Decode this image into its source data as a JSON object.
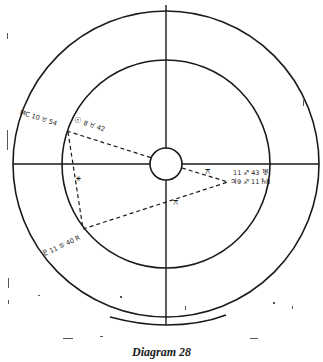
{
  "caption": "Diagram 28",
  "wheel": {
    "rings": [
      "outer",
      "inner",
      "center"
    ],
    "axes": [
      "horizontal",
      "vertical"
    ]
  },
  "labels": {
    "midheaven": {
      "glyph": "M\nC",
      "text": "MC 10 ♉ 54"
    },
    "sun": {
      "glyph": "☉",
      "text": "8 ♉ 42"
    },
    "uranus": {
      "glyph": "♅",
      "text": "11 ♐ 43"
    },
    "jupiter": {
      "glyph": "♃",
      "text": "9 ♐ 11"
    },
    "saturn_r": {
      "glyph": "♄",
      "text": "R"
    },
    "pluto": {
      "glyph": "♇",
      "text": "11 ♋ 40 R"
    }
  },
  "aspects": [
    {
      "from": "sun",
      "to": "center",
      "style": "dashed"
    },
    {
      "from": "sun",
      "to": "pluto",
      "style": "dashed",
      "symbol": "⚹"
    },
    {
      "from": "pluto",
      "to": "jupiter",
      "style": "dashed",
      "symbol": "⚻"
    },
    {
      "from": "center",
      "to": "jupiter",
      "style": "dashed",
      "symbol": "⚻"
    }
  ],
  "aspect_symbols": {
    "sextile": "⚹",
    "quincunx": "⚻"
  }
}
